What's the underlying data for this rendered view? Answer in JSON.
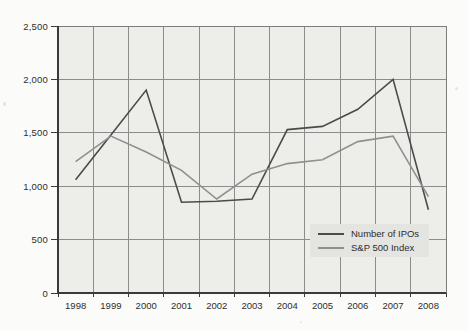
{
  "chart_data": {
    "type": "line",
    "title": "",
    "xlabel": "",
    "ylabel": "",
    "categories": [
      "1998",
      "1999",
      "2000",
      "2001",
      "2002",
      "2003",
      "2004",
      "2005",
      "2006",
      "2007",
      "2008"
    ],
    "series": [
      {
        "name": "Number of IPOs",
        "color": "#4b4b4b",
        "values": [
          1060,
          1480,
          1900,
          850,
          860,
          880,
          1530,
          1560,
          1720,
          2000,
          780
        ]
      },
      {
        "name": "S&P 500 Index",
        "color": "#8f8f8f",
        "values": [
          1229,
          1469,
          1320,
          1148,
          880,
          1112,
          1212,
          1248,
          1418,
          1468,
          903
        ]
      }
    ],
    "ylim": [
      0,
      2500
    ],
    "y_tick_interval": 500,
    "y_tick_labels": [
      "0",
      "500",
      "1,000",
      "1,500",
      "2,000",
      "2,500"
    ],
    "grid": "both vertical and horizontal gridlines on",
    "legend_position": "inset box, lower-right of plot area"
  },
  "colors": {
    "page_bg": "#fbfbf9",
    "plot_bg": "#ededea",
    "gridline": "#8c8c8c",
    "plot_border": "#7c7c7c",
    "axis": "#3a3a3a",
    "tick_label": "#2e2e2e",
    "legend_bg": "#e4e4e1",
    "series_ipo": "#4b4b4b",
    "series_sp500": "#8f8f8f"
  }
}
